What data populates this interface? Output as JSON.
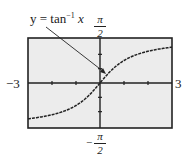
{
  "chart_data": {
    "type": "line",
    "title": "",
    "series": [
      {
        "name": "y = tan^-1 x",
        "x": [
          -3,
          -2.5,
          -2,
          -1.5,
          -1,
          -0.5,
          0,
          0.5,
          1,
          1.5,
          2,
          2.5,
          3
        ],
        "values": [
          -1.249,
          -1.19,
          -1.107,
          -0.983,
          -0.785,
          -0.464,
          0,
          0.464,
          0.785,
          0.983,
          1.107,
          1.19,
          1.249
        ]
      }
    ],
    "xlim": [
      -3,
      3
    ],
    "ylim": [
      -1.5708,
      1.5708
    ],
    "xlabel": "",
    "ylabel": "",
    "x_tick_labels": [
      "-3",
      "3"
    ],
    "y_tick_labels": [
      "-π/2",
      "π/2"
    ],
    "grid": false,
    "annotation": "y = tan^-1 x",
    "colors": {
      "curve": "#222222",
      "frame": "#222222",
      "background": "#eeeeee"
    }
  },
  "labels": {
    "func_prefix": "y = tan",
    "func_sup": "−1",
    "func_var": "x",
    "x_min": "−3",
    "x_max": "3",
    "y_top_num": "π",
    "y_top_den": "2",
    "y_bot_sign": "−",
    "y_bot_num": "π",
    "y_bot_den": "2"
  }
}
